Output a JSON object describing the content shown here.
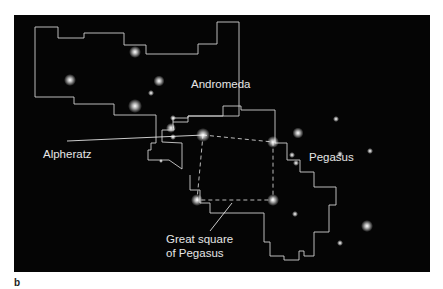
{
  "figure": {
    "panel_label": "b",
    "background_color": "#050505",
    "line_color": "#d8d8d8"
  },
  "labels": {
    "andromeda": "Andromeda",
    "pegasus": "Pegasus",
    "alpheratz": "Alpheratz",
    "great_square_line1": "Great square",
    "great_square_line2": "of Pegasus"
  }
}
